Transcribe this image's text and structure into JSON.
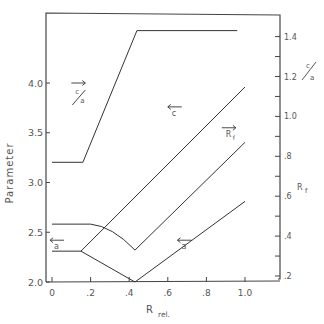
{
  "chart_data": {
    "type": "line",
    "title": "",
    "xlabel": "R",
    "xlabel_subscript": "rel.",
    "ylabel": "Parameter",
    "y2label_top": "c/a",
    "y2label_bottom": "R",
    "y2label_bottom_subscript": "f",
    "xlim": [
      -0.03,
      1.15
    ],
    "ylim": [
      2.0,
      4.6
    ],
    "y2lim": [
      0.17,
      1.5
    ],
    "grid": false,
    "x_ticks": [
      0,
      0.2,
      0.4,
      0.6,
      0.8,
      1.0
    ],
    "x_tick_labels": [
      "0",
      ".2",
      ".4",
      ".6",
      ".8",
      "1.0"
    ],
    "y_ticks": [
      2.0,
      2.5,
      3.0,
      3.5,
      4.0
    ],
    "y_tick_labels": [
      "2.0",
      "2.5",
      "3.0",
      "3.5",
      "4.0"
    ],
    "y2_ticks": [
      0.2,
      0.3,
      0.4,
      0.5,
      0.6,
      0.7,
      0.8,
      0.9,
      1.0,
      1.1,
      1.2,
      1.3,
      1.4
    ],
    "y2_tick_labels": [
      ".2",
      "",
      ".4",
      "",
      ".6",
      "",
      ".8",
      "",
      "1.0",
      "",
      "1.2",
      "",
      "1.4"
    ],
    "series": [
      {
        "name": "c/a",
        "axis": "right",
        "arrow": "right",
        "x": [
          0.0,
          0.16,
          0.44,
          0.96
        ],
        "y": [
          0.77,
          0.77,
          1.43,
          1.43
        ]
      },
      {
        "name": "c",
        "axis": "left",
        "arrow": "left",
        "x": [
          0.15,
          1.0
        ],
        "y": [
          2.31,
          3.96
        ]
      },
      {
        "name": "R_f",
        "axis": "right",
        "arrow": "right",
        "x": [
          0.0,
          0.2,
          0.28,
          0.36,
          0.43,
          1.0
        ],
        "y": [
          0.46,
          0.46,
          0.43,
          0.38,
          0.33,
          0.87
        ]
      },
      {
        "name": "a",
        "axis": "left",
        "arrow": "left",
        "x": [
          0.0,
          0.15,
          0.43,
          1.0
        ],
        "y": [
          2.31,
          2.31,
          2.0,
          2.81
        ]
      }
    ],
    "annotations": [
      {
        "text": "c/a",
        "arrow": "right",
        "near_series": "c/a",
        "at": [
          0.1,
          4.0
        ]
      },
      {
        "text": "c",
        "arrow": "left",
        "near_series": "c",
        "at": [
          0.6,
          3.76
        ]
      },
      {
        "text": "R",
        "subscript": "f",
        "arrow": "right",
        "near_series": "R_f",
        "at": [
          0.88,
          3.55
        ]
      },
      {
        "text": "a",
        "arrow": "left",
        "near_series": "a",
        "at": [
          0.65,
          2.42
        ]
      },
      {
        "text": "a",
        "arrow": "left",
        "near_series": "a",
        "at": [
          -0.01,
          2.42
        ]
      }
    ]
  }
}
